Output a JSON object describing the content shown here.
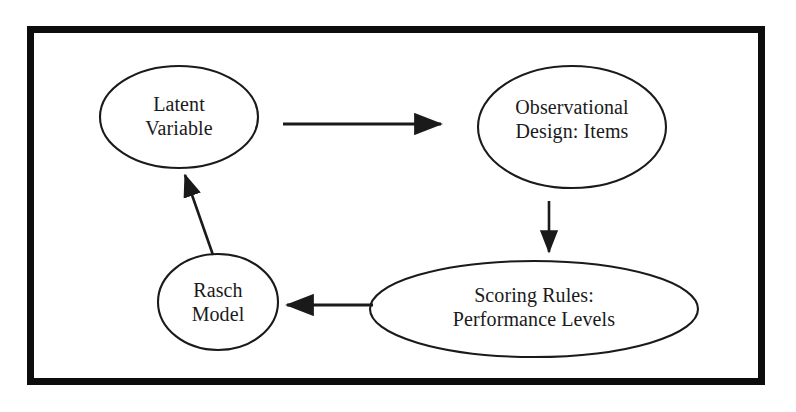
{
  "diagram": {
    "frame": {
      "border_color": "#0d0d0d",
      "background_color": "#ffffff"
    },
    "stroke_color": "#1a1a1a",
    "nodes": [
      {
        "id": "latent-variable",
        "label": "Latent\nVariable",
        "shape": "ellipse",
        "cx": 179,
        "cy": 117,
        "rx": 79,
        "ry": 51
      },
      {
        "id": "observational-design",
        "label": "Observational\nDesign: Items",
        "shape": "ellipse",
        "cx": 572,
        "cy": 127,
        "rx": 94,
        "ry": 61
      },
      {
        "id": "scoring-rules",
        "label": "Scoring Rules:\nPerformance Levels",
        "shape": "ellipse",
        "cx": 534,
        "cy": 309,
        "rx": 164,
        "ry": 48
      },
      {
        "id": "rasch-model",
        "label": "Rasch\nModel",
        "shape": "ellipse",
        "cx": 218,
        "cy": 302,
        "rx": 60,
        "ry": 48
      }
    ],
    "edges": [
      {
        "id": "latent-to-observational",
        "from": "latent-variable",
        "to": "observational-design",
        "direction": "right",
        "x1": 283,
        "y1": 124,
        "x2": 443,
        "y2": 124
      },
      {
        "id": "observational-to-scoring",
        "from": "observational-design",
        "to": "scoring-rules",
        "direction": "down",
        "x1": 549,
        "y1": 201,
        "x2": 549,
        "y2": 255
      },
      {
        "id": "scoring-to-rasch",
        "from": "scoring-rules",
        "to": "rasch-model",
        "direction": "left",
        "x1": 373,
        "y1": 305,
        "x2": 284,
        "y2": 305
      },
      {
        "id": "rasch-to-latent",
        "from": "rasch-model",
        "to": "latent-variable",
        "direction": "up-left",
        "x1": 213,
        "y1": 255,
        "x2": 184,
        "y2": 172
      }
    ]
  }
}
